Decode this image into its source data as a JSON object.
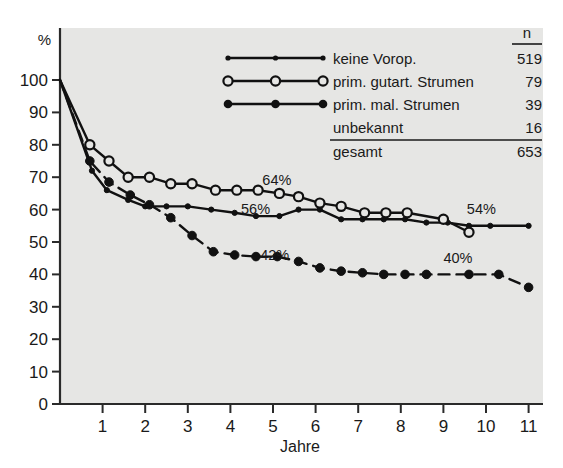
{
  "chart_data": {
    "type": "line",
    "title": "",
    "xlabel": "Jahre",
    "ylabel": "%",
    "xlim": [
      0,
      11
    ],
    "ylim": [
      0,
      100
    ],
    "grid": false,
    "legend_position": "top-right",
    "x_ticks": [
      "1",
      "2",
      "3",
      "4",
      "5",
      "6",
      "7",
      "8",
      "9",
      "10",
      "11"
    ],
    "x_tick_values": [
      1,
      2,
      3,
      4,
      5,
      6,
      7,
      8,
      9,
      10,
      11
    ],
    "y_ticks": [
      "0",
      "10",
      "20",
      "30",
      "40",
      "50",
      "60",
      "70",
      "80",
      "90",
      "100"
    ],
    "y_tick_values": [
      0,
      10,
      20,
      30,
      40,
      50,
      60,
      70,
      80,
      90,
      100
    ],
    "series": [
      {
        "name": "keine Vorop.",
        "n": "519",
        "marker": "small-filled-circle",
        "line_style": "solid",
        "color": "#111111",
        "x": [
          0,
          0.75,
          1.1,
          1.6,
          2.0,
          2.5,
          3.0,
          3.55,
          4.1,
          4.6,
          5.15,
          5.6,
          6.1,
          6.6,
          7.1,
          7.6,
          8.1,
          8.6,
          9.1,
          9.6,
          10.1,
          11.0
        ],
        "y": [
          100,
          72,
          66,
          63,
          61,
          61,
          61,
          60,
          59,
          58,
          58,
          60,
          60,
          57,
          57,
          57,
          57,
          56,
          56,
          55,
          55,
          55
        ]
      },
      {
        "name": "prim. gutart. Strumen",
        "n": "79",
        "marker": "open-circle",
        "line_style": "solid",
        "color": "#111111",
        "x": [
          0,
          0.7,
          1.15,
          1.6,
          2.1,
          2.6,
          3.1,
          3.65,
          4.15,
          4.65,
          5.15,
          5.6,
          6.1,
          6.6,
          7.15,
          7.65,
          8.15,
          9.0,
          9.6
        ],
        "y": [
          100,
          80,
          75,
          70,
          70,
          68,
          68,
          66,
          66,
          66,
          65,
          64,
          62,
          61,
          59,
          59,
          59,
          57,
          53
        ]
      },
      {
        "name": "prim. mal. Strumen",
        "n": "39",
        "marker": "large-filled-circle",
        "line_style": "dashed",
        "color": "#111111",
        "x": [
          0,
          0.7,
          1.15,
          1.65,
          2.1,
          2.6,
          3.1,
          3.6,
          4.1,
          4.6,
          5.1,
          5.6,
          6.1,
          6.6,
          7.1,
          7.6,
          8.1,
          8.6,
          9.6,
          10.3,
          11.0
        ],
        "y": [
          100,
          75,
          68.5,
          64.5,
          61.5,
          57.5,
          52,
          47,
          46,
          45.5,
          45.5,
          44,
          42,
          41,
          40.5,
          40,
          40,
          40,
          40,
          40,
          36
        ]
      },
      {
        "name": "unbekannt",
        "n": "16",
        "marker": "none",
        "line_style": "none",
        "color": "#111111",
        "x": [],
        "y": []
      }
    ],
    "total_label": "gesamt",
    "total_n": "653",
    "n_header": "n",
    "annotations": [
      {
        "text": "64%",
        "x": 4.75,
        "y": 67.5
      },
      {
        "text": "56%",
        "x": 4.25,
        "y": 58.5
      },
      {
        "text": "42%",
        "x": 4.7,
        "y": 44.5
      },
      {
        "text": "54%",
        "x": 9.55,
        "y": 58.5
      },
      {
        "text": "40%",
        "x": 9.0,
        "y": 43.5
      }
    ]
  },
  "legend": {
    "header_n": "n",
    "rows": [
      {
        "label": "keine Vorop.",
        "n": "519",
        "marker": "small-filled-circle"
      },
      {
        "label": "prim. gutart. Strumen",
        "n": "79",
        "marker": "open-circle"
      },
      {
        "label": "prim. mal. Strumen",
        "n": "39",
        "marker": "large-filled-circle"
      },
      {
        "label": "unbekannt",
        "n": "16",
        "marker": "none"
      }
    ],
    "total": {
      "label": "gesamt",
      "n": "653"
    }
  },
  "axes": {
    "y_unit": "%",
    "x_title": "Jahre"
  }
}
